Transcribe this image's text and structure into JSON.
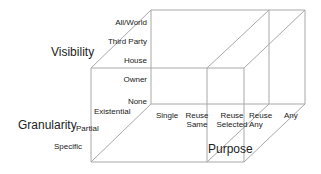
{
  "diagram": {
    "type": "3d-cube-axes",
    "line_color": "#a8a8a8",
    "axes": {
      "visibility": {
        "title": "Visibility",
        "levels": [
          "None",
          "Owner",
          "House",
          "Third Party",
          "All/World"
        ]
      },
      "granularity": {
        "title": "Granularity",
        "levels": [
          "Existential",
          "Partial",
          "Specific"
        ]
      },
      "purpose": {
        "title": "Purpose",
        "levels": [
          {
            "line1": "Single",
            "line2": ""
          },
          {
            "line1": "Reuse",
            "line2": "Same"
          },
          {
            "line1": "Reuse",
            "line2": "Selected"
          },
          {
            "line1": "Reuse",
            "line2": "Any"
          },
          {
            "line1": "Any",
            "line2": ""
          }
        ]
      }
    }
  }
}
